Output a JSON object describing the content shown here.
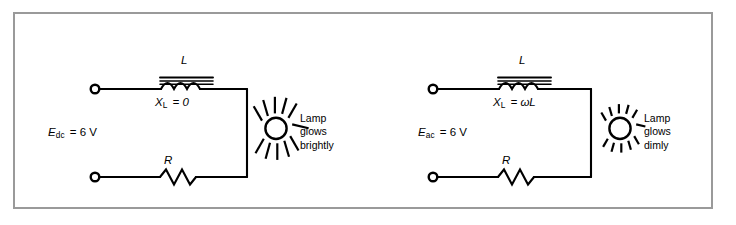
{
  "figure": {
    "type": "schematic-diagram",
    "title": "",
    "border_color": "#9a9a9a",
    "line_color": "#000000",
    "background": "#ffffff"
  },
  "circuits": [
    {
      "id": "dc-circuit",
      "source_label_symbol": "E",
      "source_label_sub": "dc",
      "source_label_value": "=  6 V",
      "inductor_label": "L",
      "reactance_symbol": "X",
      "reactance_sub": "L",
      "reactance_value": "=  0",
      "resistor_label": "R",
      "lamp_caption_line1": "Lamp",
      "lamp_caption_line2": "glows",
      "lamp_caption_line3": "brightly",
      "lamp_state": "bright",
      "ray_count": 11,
      "ray_length": 16
    },
    {
      "id": "ac-circuit",
      "source_label_symbol": "E",
      "source_label_sub": "ac",
      "source_label_value": "=  6 V",
      "inductor_label": "L",
      "reactance_symbol": "X",
      "reactance_sub": "L",
      "reactance_value": "=  ωL",
      "resistor_label": "R",
      "lamp_caption_line1": "Lamp",
      "lamp_caption_line2": "glows",
      "lamp_caption_line3": "dimly",
      "lamp_state": "dim",
      "ray_count": 11,
      "ray_length": 9
    }
  ]
}
